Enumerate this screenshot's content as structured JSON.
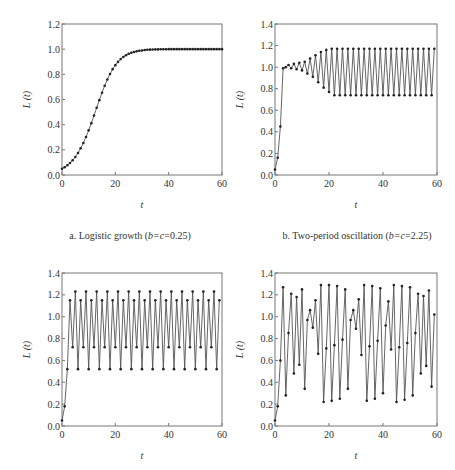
{
  "chart_data": [
    {
      "id": "a",
      "type": "line",
      "title": "",
      "caption": {
        "prefix": "a. Logistic growth (",
        "param": "b=c",
        "value": "=0.25)"
      },
      "xlabel": "t",
      "ylabel": "L (t)",
      "xlim": [
        0,
        60
      ],
      "ylim": [
        0,
        1.2
      ],
      "xticks": [
        0,
        20,
        40,
        60
      ],
      "yticks": [
        0.0,
        0.2,
        0.4,
        0.6,
        0.8,
        1.0,
        1.2
      ],
      "grid": false,
      "markers": true,
      "x": [
        0,
        1,
        2,
        3,
        4,
        5,
        6,
        7,
        8,
        9,
        10,
        11,
        12,
        13,
        14,
        15,
        16,
        17,
        18,
        19,
        20,
        21,
        22,
        23,
        24,
        25,
        26,
        27,
        28,
        29,
        30,
        31,
        32,
        33,
        34,
        35,
        36,
        37,
        38,
        39,
        40,
        41,
        42,
        43,
        44,
        45,
        46,
        47,
        48,
        49,
        50,
        51,
        52,
        53,
        54,
        55,
        56,
        57,
        58,
        59,
        60
      ],
      "values": [
        0.05,
        0.062,
        0.077,
        0.095,
        0.117,
        0.143,
        0.175,
        0.212,
        0.254,
        0.302,
        0.355,
        0.412,
        0.472,
        0.534,
        0.595,
        0.654,
        0.709,
        0.759,
        0.803,
        0.841,
        0.873,
        0.899,
        0.921,
        0.938,
        0.952,
        0.963,
        0.972,
        0.978,
        0.983,
        0.987,
        0.99,
        0.993,
        0.995,
        0.996,
        0.997,
        0.998,
        0.998,
        0.999,
        0.999,
        0.999,
        1.0,
        1.0,
        1.0,
        1.0,
        1.0,
        1.0,
        1.0,
        1.0,
        1.0,
        1.0,
        1.0,
        1.0,
        1.0,
        1.0,
        1.0,
        1.0,
        1.0,
        1.0,
        1.0,
        1.0,
        1.0
      ]
    },
    {
      "id": "b",
      "type": "line",
      "title": "",
      "caption": {
        "prefix": "b. Two-period oscillation (",
        "param": "b=c",
        "value": "=2.25)"
      },
      "xlabel": "t",
      "ylabel": "L (t)",
      "xlim": [
        0,
        60
      ],
      "ylim": [
        0,
        1.4
      ],
      "xticks": [
        0,
        20,
        40,
        60
      ],
      "yticks": [
        0.0,
        0.2,
        0.4,
        0.6,
        0.8,
        1.0,
        1.2,
        1.4
      ],
      "grid": false,
      "markers": true,
      "x": [
        0,
        1,
        2,
        3,
        4,
        5,
        6,
        7,
        8,
        9,
        10,
        11,
        12,
        13,
        14,
        15,
        16,
        17,
        18,
        19,
        20,
        21,
        22,
        23,
        24,
        25,
        26,
        27,
        28,
        29,
        30,
        31,
        32,
        33,
        34,
        35,
        36,
        37,
        38,
        39,
        40,
        41,
        42,
        43,
        44,
        45,
        46,
        47,
        48,
        49,
        50,
        51,
        52,
        53,
        54,
        55,
        56,
        57,
        58,
        59
      ],
      "values": [
        0.05,
        0.16,
        0.45,
        0.99,
        1.0,
        1.02,
        0.99,
        1.03,
        0.98,
        1.04,
        0.97,
        1.05,
        0.94,
        1.08,
        0.91,
        1.11,
        0.86,
        1.14,
        0.81,
        1.16,
        0.77,
        1.17,
        0.74,
        1.17,
        0.74,
        1.17,
        0.74,
        1.17,
        0.74,
        1.17,
        0.74,
        1.17,
        0.74,
        1.17,
        0.74,
        1.17,
        0.74,
        1.17,
        0.74,
        1.17,
        0.74,
        1.17,
        0.74,
        1.17,
        0.74,
        1.17,
        0.74,
        1.17,
        0.74,
        1.17,
        0.74,
        1.17,
        0.74,
        1.17,
        0.74,
        1.17,
        0.74,
        1.17,
        0.74,
        1.17
      ]
    },
    {
      "id": "c",
      "type": "line",
      "title": "",
      "caption": null,
      "xlabel": "t",
      "ylabel": "L (t)",
      "xlim": [
        0,
        60
      ],
      "ylim": [
        0,
        1.4
      ],
      "xticks": [
        0,
        20,
        40,
        60
      ],
      "yticks": [
        0.0,
        0.2,
        0.4,
        0.6,
        0.8,
        1.0,
        1.2,
        1.4
      ],
      "grid": false,
      "markers": true,
      "x": [
        0,
        1,
        2,
        3,
        4,
        5,
        6,
        7,
        8,
        9,
        10,
        11,
        12,
        13,
        14,
        15,
        16,
        17,
        18,
        19,
        20,
        21,
        22,
        23,
        24,
        25,
        26,
        27,
        28,
        29,
        30,
        31,
        32,
        33,
        34,
        35,
        36,
        37,
        38,
        39,
        40,
        41,
        42,
        43,
        44,
        45,
        46,
        47,
        48,
        49,
        50,
        51,
        52,
        53,
        54,
        55,
        56,
        57,
        58,
        59
      ],
      "values": [
        0.05,
        0.18,
        0.52,
        1.15,
        0.72,
        1.23,
        0.52,
        1.15,
        0.72,
        1.23,
        0.52,
        1.15,
        0.72,
        1.23,
        0.52,
        1.15,
        0.72,
        1.23,
        0.52,
        1.15,
        0.72,
        1.23,
        0.52,
        1.15,
        0.72,
        1.23,
        0.52,
        1.15,
        0.72,
        1.23,
        0.52,
        1.15,
        0.72,
        1.23,
        0.52,
        1.15,
        0.72,
        1.23,
        0.52,
        1.15,
        0.72,
        1.23,
        0.52,
        1.15,
        0.72,
        1.23,
        0.52,
        1.15,
        0.72,
        1.23,
        0.52,
        1.15,
        0.72,
        1.23,
        0.52,
        1.15,
        0.72,
        1.23,
        0.52,
        1.15
      ]
    },
    {
      "id": "d",
      "type": "line",
      "title": "",
      "caption": null,
      "xlabel": "t",
      "ylabel": "L (t)",
      "xlim": [
        0,
        60
      ],
      "ylim": [
        0,
        1.4
      ],
      "xticks": [
        0,
        20,
        40,
        60
      ],
      "yticks": [
        0.0,
        0.2,
        0.4,
        0.6,
        0.8,
        1.0,
        1.2,
        1.4
      ],
      "grid": false,
      "markers": true,
      "x": [
        0,
        1,
        2,
        3,
        4,
        5,
        6,
        7,
        8,
        9,
        10,
        11,
        12,
        13,
        14,
        15,
        16,
        17,
        18,
        19,
        20,
        21,
        22,
        23,
        24,
        25,
        26,
        27,
        28,
        29,
        30,
        31,
        32,
        33,
        34,
        35,
        36,
        37,
        38,
        39,
        40,
        41,
        42,
        43,
        44,
        45,
        46,
        47,
        48,
        49,
        50,
        51,
        52,
        53,
        54,
        55,
        56,
        57,
        58,
        59
      ],
      "values": [
        0.05,
        0.18,
        0.6,
        1.27,
        0.28,
        0.85,
        1.21,
        0.48,
        1.18,
        0.56,
        1.25,
        0.34,
        0.97,
        1.06,
        0.9,
        1.15,
        0.66,
        1.29,
        0.22,
        0.71,
        1.29,
        0.23,
        0.74,
        1.28,
        0.25,
        0.79,
        1.25,
        0.34,
        0.97,
        1.06,
        0.89,
        1.16,
        0.65,
        1.29,
        0.23,
        0.73,
        1.28,
        0.25,
        0.78,
        1.26,
        0.3,
        0.92,
        1.14,
        0.7,
        1.29,
        0.22,
        0.72,
        1.28,
        0.24,
        0.76,
        1.27,
        0.28,
        0.85,
        1.21,
        0.48,
        1.19,
        0.55,
        1.24,
        0.36,
        1.02
      ]
    }
  ],
  "styles": {
    "line_color": "#555555",
    "marker_color": "#222222",
    "axis_color": "#777777",
    "text_color": "#333333"
  },
  "captions": {
    "a": {
      "prefix": "a. Logistic growth (",
      "param": "b=c",
      "value": "=0.25)"
    },
    "b": {
      "prefix": "b. Two-period oscillation (",
      "param": "b=c",
      "value": "=2.25)"
    }
  }
}
